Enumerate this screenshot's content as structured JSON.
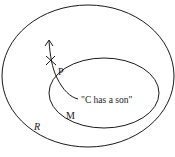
{
  "diagram": {
    "outer_region": {
      "label": "R"
    },
    "inner_region": {
      "label": "M"
    },
    "path": {
      "label": "P",
      "end_label": "\"C has a son\""
    },
    "colors": {
      "stroke": "#1a1a1a",
      "background": "#ffffff"
    }
  }
}
